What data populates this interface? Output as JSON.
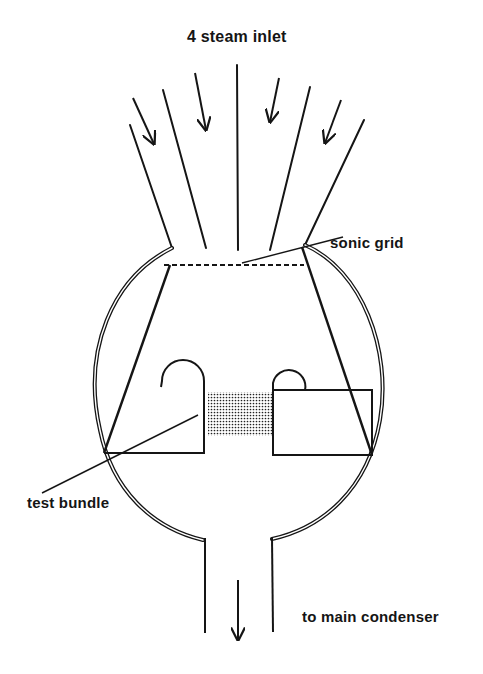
{
  "figure": {
    "title": "4 steam inlet",
    "ink_color": "#151515",
    "background_color": "#ffffff"
  },
  "labels": {
    "inlet": "4 steam inlet",
    "sonic_grid": "sonic grid",
    "test_bundle": "test bundle",
    "outlet": "to main condenser"
  },
  "components": [
    {
      "id": "steam-inlet-channels",
      "description": "4 diverging inlet channels with flow arrows"
    },
    {
      "id": "vessel",
      "description": "spherical vessel drawn with double wall"
    },
    {
      "id": "sonic-grid",
      "description": "dashed horizontal line across top of converging duct"
    },
    {
      "id": "converging-duct",
      "description": "trapezoidal duct walls inside vessel"
    },
    {
      "id": "test-bundle",
      "description": "stippled rectangle between two baffle blocks"
    },
    {
      "id": "outlet-pipe",
      "description": "vertical pipe at bottom with downward flow arrow"
    }
  ],
  "geometry": {
    "inlet_lines": [
      [
        130,
        125,
        172,
        248
      ],
      [
        163,
        90,
        206,
        248
      ],
      [
        237,
        65,
        238,
        250
      ],
      [
        310,
        87,
        270,
        250
      ],
      [
        364,
        120,
        305,
        245
      ]
    ],
    "inlet_arrows": [
      [
        133,
        98,
        154,
        144
      ],
      [
        195,
        73,
        206,
        130
      ],
      [
        279,
        78,
        270,
        122
      ],
      [
        341,
        100,
        325,
        143
      ]
    ],
    "vessel_left_arc": "M172,248 C112,278 82,350 100,430 C112,490 152,528 203,540",
    "vessel_right_arc": "M305,245 C362,270 392,350 380,420 C368,490 322,528 272,539",
    "duct_walls": [
      [
        170,
        265,
        104,
        453
      ],
      [
        302,
        247,
        372,
        455
      ]
    ],
    "sonic_grid": [
      164,
      265,
      304,
      265
    ],
    "sonic_leader": [
      242,
      263,
      343,
      237
    ],
    "bundle_leader": [
      198,
      415,
      42,
      493
    ],
    "left_block": "M104,453 L204,453 L204,381 A21,21 0 0 0 162,381 L161,387",
    "right_block_rect": [
      273,
      390,
      372,
      455
    ],
    "right_block_dome": "M273,390 L273,383 A16,16 0 0 1 305,390",
    "bundle_rect": [
      208,
      392,
      272,
      436
    ],
    "outlet_lines": [
      [
        205,
        538,
        205,
        633
      ],
      [
        272,
        538,
        273,
        632
      ]
    ],
    "outlet_arrow": [
      238,
      580,
      238,
      640
    ]
  }
}
